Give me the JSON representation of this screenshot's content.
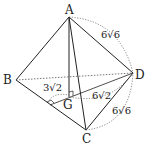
{
  "figure": {
    "type": "tetrahedron",
    "vertices": {
      "A": {
        "label": "A",
        "x": 69,
        "y": 17
      },
      "B": {
        "label": "B",
        "x": 16,
        "y": 80
      },
      "C": {
        "label": "C",
        "x": 86,
        "y": 130
      },
      "D": {
        "label": "D",
        "x": 133,
        "y": 73
      },
      "G": {
        "label": "G",
        "x": 70,
        "y": 97
      }
    },
    "midpoint_M": {
      "x": 50,
      "y": 105
    },
    "lengths": {
      "AD": "6√6",
      "CD": "6√6",
      "MG": "3√2",
      "GD": "6√2"
    },
    "colors": {
      "line": "#222222",
      "dashed": "#555555"
    }
  }
}
